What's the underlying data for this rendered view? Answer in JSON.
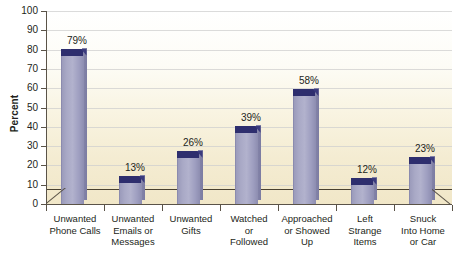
{
  "chart_data": {
    "type": "bar",
    "title": "",
    "subtitle": "",
    "xlabel": "",
    "ylabel": "Percent",
    "ylim": [
      0,
      100
    ],
    "ytick_step": 10,
    "yticks": [
      100,
      90,
      80,
      70,
      60,
      50,
      40,
      30,
      20,
      10,
      0
    ],
    "grid": true,
    "legend": "none",
    "value_suffix": "%",
    "categories": [
      "Unwanted\nPhone Calls",
      "Unwanted\nEmails or\nMessages",
      "Unwanted\nGifts",
      "Watched\nor\nFollowed",
      "Approached\nor Showed\nUp",
      "Left\nStrange\nItems",
      "Snuck\nInto Home\nor Car"
    ],
    "values": [
      79,
      13,
      26,
      39,
      58,
      12,
      23
    ],
    "value_labels": [
      "79%",
      "13%",
      "26%",
      "39%",
      "58%",
      "12%",
      "23%"
    ],
    "colors": {
      "bar_face": "#a9a9c6",
      "bar_top": "#2e2e6e",
      "bar_side": "#8787ab",
      "axis": "#5a5348",
      "grid": "#cfcfcf",
      "text": "#231f20",
      "plot_bg_top": "#ffffff",
      "plot_bg_bottom": "#f1e7c8"
    }
  }
}
